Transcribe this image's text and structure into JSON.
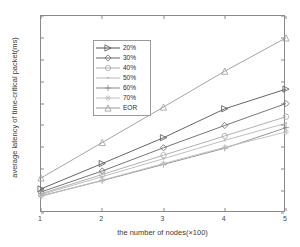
{
  "chart_data": {
    "type": "line",
    "title": "",
    "xlabel": "the number of nodes(×100)",
    "ylabel": "average latency of time-critical packet(ms)",
    "x": [
      1,
      2,
      3,
      4,
      5
    ],
    "xlim": [
      1,
      5
    ],
    "ylim": [
      0,
      450
    ],
    "xticks": [
      "1",
      "2",
      "3",
      "4",
      "5"
    ],
    "yticks": [
      "0",
      "50",
      "100",
      "150",
      "200",
      "250",
      "300",
      "350",
      "400",
      "450"
    ],
    "grid": false,
    "legend_position": "upper left",
    "series": [
      {
        "name": "20%",
        "marker": "triangle-right",
        "color": "#555555",
        "values": [
          55,
          113,
          172,
          238,
          283
        ]
      },
      {
        "name": "30%",
        "marker": "diamond",
        "color": "#666666",
        "values": [
          48,
          96,
          149,
          200,
          250
        ]
      },
      {
        "name": "40%",
        "marker": "circle",
        "color": "#a8a8a8",
        "values": [
          44,
          88,
          132,
          176,
          220
        ]
      },
      {
        "name": "50%",
        "marker": "dot",
        "color": "#b8b8b8",
        "values": [
          42,
          83,
          124,
          166,
          205
        ]
      },
      {
        "name": "60%",
        "marker": "plus",
        "color": "#8a8a8a",
        "values": [
          39,
          74,
          111,
          148,
          195
        ]
      },
      {
        "name": "70%",
        "marker": "star",
        "color": "#c0c0c0",
        "values": [
          38,
          75,
          113,
          150,
          185
        ]
      },
      {
        "name": "EOR",
        "marker": "triangle-up",
        "color": "#9a9a9a",
        "values": [
          80,
          161,
          242,
          324,
          400
        ]
      }
    ]
  },
  "legend": {
    "entries": [
      "20%",
      "30%",
      "40%",
      "50%",
      "60%",
      "70%",
      "EOR"
    ]
  }
}
